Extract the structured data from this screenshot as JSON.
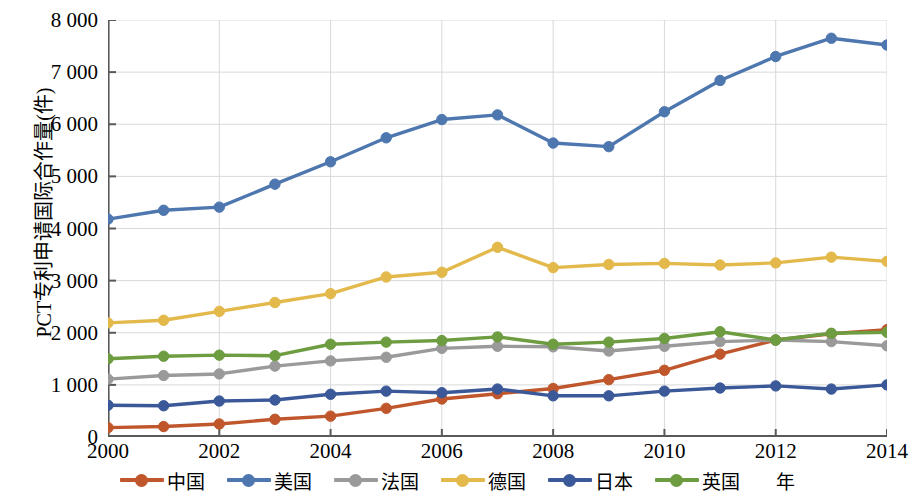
{
  "chart_data": {
    "type": "line",
    "title": "",
    "xlabel": "年",
    "ylabel": "PCT专利申请国际合作量(件)",
    "xlim": [
      2000,
      2014
    ],
    "ylim": [
      0,
      8000
    ],
    "grid": true,
    "legend_position": "bottom",
    "x": [
      2000,
      2001,
      2002,
      2003,
      2004,
      2005,
      2006,
      2007,
      2008,
      2009,
      2010,
      2011,
      2012,
      2013,
      2014
    ],
    "x_tick_labels": [
      "2000",
      "2002",
      "2004",
      "2006",
      "2008",
      "2010",
      "2012",
      "2014"
    ],
    "x_tick_values": [
      2000,
      2002,
      2004,
      2006,
      2008,
      2010,
      2012,
      2014
    ],
    "y_tick_labels": [
      "0",
      "1 000",
      "2 000",
      "3 000",
      "4 000",
      "5 000",
      "6 000",
      "7 000",
      "8 000"
    ],
    "y_tick_values": [
      0,
      1000,
      2000,
      3000,
      4000,
      5000,
      6000,
      7000,
      8000
    ],
    "series": [
      {
        "name": "中国",
        "color": "#C0562B",
        "values": [
          180,
          200,
          250,
          340,
          400,
          550,
          730,
          830,
          930,
          1100,
          1280,
          1590,
          1860,
          1980,
          2060
        ]
      },
      {
        "name": "美国",
        "color": "#4D77AE",
        "values": [
          4180,
          4350,
          4410,
          4850,
          5280,
          5740,
          6090,
          6180,
          5640,
          5570,
          6240,
          6840,
          7300,
          7650,
          7520
        ]
      },
      {
        "name": "法国",
        "color": "#9A9A9A",
        "values": [
          1110,
          1180,
          1210,
          1360,
          1460,
          1530,
          1700,
          1740,
          1730,
          1650,
          1740,
          1830,
          1860,
          1830,
          1750
        ]
      },
      {
        "name": "德国",
        "color": "#E3B94C",
        "values": [
          2190,
          2240,
          2410,
          2580,
          2750,
          3070,
          3160,
          3640,
          3250,
          3310,
          3330,
          3300,
          3340,
          3450,
          3370
        ]
      },
      {
        "name": "日本",
        "color": "#3B5998",
        "values": [
          610,
          600,
          690,
          710,
          820,
          880,
          850,
          920,
          790,
          790,
          880,
          940,
          980,
          920,
          1000
        ]
      },
      {
        "name": "英国",
        "color": "#6D9C41",
        "values": [
          1500,
          1550,
          1570,
          1560,
          1780,
          1820,
          1850,
          1920,
          1780,
          1820,
          1890,
          2020,
          1860,
          1990,
          2010
        ]
      }
    ]
  },
  "axes": {
    "y_title": "PCT专利申请国际合作量(件)",
    "x_title": "年"
  }
}
